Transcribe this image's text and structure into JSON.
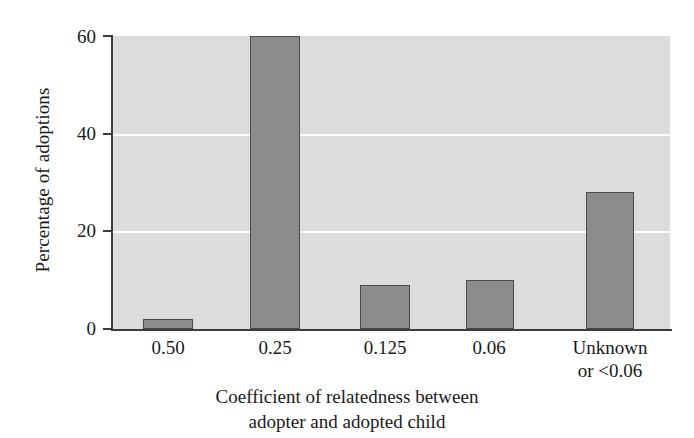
{
  "chart_data": {
    "type": "bar",
    "title": "",
    "subtitle": "",
    "xlabel_line1": "Coefficient of relatedness between",
    "xlabel_line2": "adopter and adopted child",
    "ylabel": "Percentage of adoptions",
    "categories": [
      "0.50",
      "0.25",
      "0.125",
      "0.06",
      "Unknown or <0.06"
    ],
    "category_lines": [
      [
        "0.50"
      ],
      [
        "0.25"
      ],
      [
        "0.125"
      ],
      [
        "0.06"
      ],
      [
        "Unknown",
        "or <0.06"
      ]
    ],
    "values": [
      2,
      60,
      9,
      10,
      28
    ],
    "ylim": [
      0,
      60
    ],
    "yticks": [
      0,
      20,
      40,
      60
    ],
    "ytick_labels": [
      "0",
      "20",
      "40",
      "60"
    ],
    "grid": "horizontal-white-at-20-and-40",
    "legend": "none",
    "colors": {
      "bar_fill": "#8c8c8c",
      "bar_edge": "#4a4a4a",
      "plot_background": "#dcdcdc",
      "gridline": "#fbfbfb",
      "axis": "#3b3b3b",
      "figure_background": "#ffffff",
      "text": "#1a1a1a"
    }
  }
}
